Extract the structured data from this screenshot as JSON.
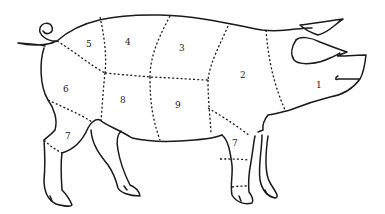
{
  "diagram": {
    "regions": [
      {
        "id": "1",
        "label": "1",
        "x": 316,
        "y": 88
      },
      {
        "id": "2",
        "label": "2",
        "x": 242,
        "y": 78
      },
      {
        "id": "3",
        "label": "3",
        "x": 181,
        "y": 51
      },
      {
        "id": "4",
        "label": "4",
        "x": 127,
        "y": 45
      },
      {
        "id": "5",
        "label": "5",
        "x": 88,
        "y": 47
      },
      {
        "id": "6",
        "label": "6",
        "x": 66,
        "y": 92
      },
      {
        "id": "7a",
        "label": "7",
        "x": 68,
        "y": 139
      },
      {
        "id": "8",
        "label": "8",
        "x": 123,
        "y": 103
      },
      {
        "id": "9",
        "label": "9",
        "x": 178,
        "y": 108
      },
      {
        "id": "7b",
        "label": "7",
        "x": 234,
        "y": 146
      }
    ]
  }
}
